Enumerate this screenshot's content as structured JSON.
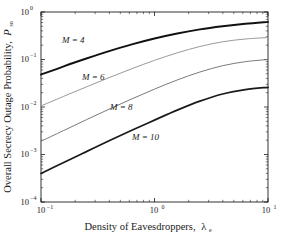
{
  "chart_data": {
    "type": "line",
    "title": "",
    "xlabel": "Density of Eavesdroppers, λₑ",
    "ylabel": "Overall Secrecy Outage Probability, 𝒫so",
    "xscale": "log",
    "yscale": "log",
    "xlim": [
      0.1,
      10
    ],
    "ylim": [
      0.0001,
      1
    ],
    "grid": false,
    "legend_position": "inline-curve-labels",
    "xticks": [
      "10⁻¹",
      "10⁰",
      "10¹"
    ],
    "xtick_values": [
      0.1,
      1,
      10
    ],
    "yticks": [
      "10⁰",
      "10⁻¹",
      "10⁻²",
      "10⁻³",
      "10⁻⁴"
    ],
    "ytick_values": [
      1,
      0.1,
      0.01,
      0.001,
      0.0001
    ],
    "x": [
      0.1,
      0.1585,
      0.2512,
      0.3981,
      0.631,
      1.0,
      1.585,
      2.512,
      3.981,
      6.31,
      10.0
    ],
    "series": [
      {
        "name": "M = 4",
        "label_text": "M = 4",
        "color": "#111111",
        "linewidth": 1.9,
        "values": [
          0.048,
          0.072,
          0.105,
          0.15,
          0.208,
          0.277,
          0.353,
          0.43,
          0.5,
          0.565,
          0.62
        ]
      },
      {
        "name": "M = 6",
        "label_text": "M = 6",
        "color": "#9a9a9a",
        "linewidth": 1.0,
        "values": [
          0.0105,
          0.0168,
          0.0265,
          0.0415,
          0.064,
          0.096,
          0.138,
          0.188,
          0.236,
          0.27,
          0.29
        ]
      },
      {
        "name": "M = 8",
        "label_text": "M = 8",
        "color": "#7a7a7a",
        "linewidth": 1.0,
        "values": [
          0.0019,
          0.0032,
          0.0054,
          0.009,
          0.0148,
          0.0238,
          0.037,
          0.0545,
          0.074,
          0.09,
          0.1
        ]
      },
      {
        "name": "M = 10",
        "label_text": "M = 10",
        "color": "#1a1a1a",
        "linewidth": 1.7,
        "values": [
          0.0004,
          0.00068,
          0.00115,
          0.00195,
          0.00325,
          0.0053,
          0.0086,
          0.0133,
          0.0188,
          0.0233,
          0.026
        ]
      }
    ],
    "annotations": [
      {
        "text": "M = 4",
        "x_px": 62,
        "y_px": 43
      },
      {
        "text": "M = 6",
        "x_px": 82,
        "y_px": 80
      },
      {
        "text": "M = 8",
        "x_px": 110,
        "y_px": 110
      },
      {
        "text": "M = 10",
        "x_px": 132,
        "y_px": 140
      }
    ]
  },
  "axes": {
    "ylabel_main": "Overall Secrecy Outage Probability,",
    "ylabel_symbol": "P",
    "ylabel_symbol_sub": "so",
    "xlabel_main": "Density of Eavesdroppers,",
    "xlabel_symbol": "λ",
    "xlabel_symbol_sub": "e",
    "xtick0_base": "10",
    "xtick0_exp": "−1",
    "xtick1_base": "10",
    "xtick1_exp": "0",
    "xtick2_base": "10",
    "xtick2_exp": "1",
    "ytick0_base": "10",
    "ytick0_exp": "0",
    "ytick1_base": "10",
    "ytick1_exp": "−1",
    "ytick2_base": "10",
    "ytick2_exp": "−2",
    "ytick3_base": "10",
    "ytick3_exp": "−3",
    "ytick4_base": "10",
    "ytick4_exp": "−4"
  },
  "labels": {
    "m4": "M = 4",
    "m6": "M = 6",
    "m8": "M = 8",
    "m10": "M = 10"
  }
}
